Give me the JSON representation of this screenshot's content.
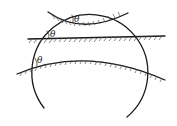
{
  "diagram": {
    "labels": {
      "angle_top": "θ",
      "angle_middle": "θ",
      "angle_bottom": "θ"
    },
    "colors": {
      "stroke": "#1a1a1a",
      "hatch": "#555555",
      "background": "#ffffff"
    }
  }
}
